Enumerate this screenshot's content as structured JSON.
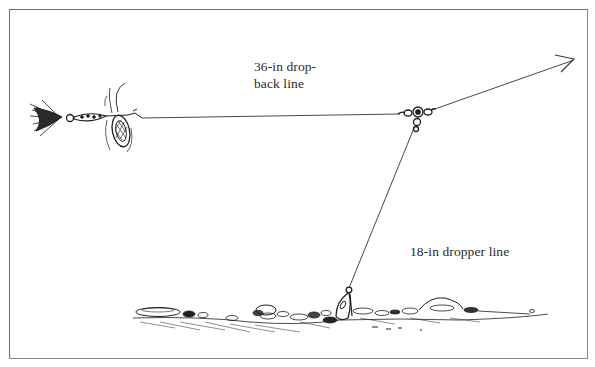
{
  "figure": {
    "labels": {
      "dropback_line_1": "36-in drop-",
      "dropback_line_2": "back line",
      "dropper_line": "18-in dropper line"
    },
    "elements": [
      {
        "name": "spinner-lure",
        "description": "in-line spinner with hair tail and blade, at end of drop-back line"
      },
      {
        "name": "three-way-swivel",
        "description": "three-way swivel connecting main line, drop-back line, and dropper line"
      },
      {
        "name": "main-line-arrow",
        "description": "main line leading up and right toward rod, with arrowhead"
      },
      {
        "name": "sinker",
        "description": "bell sinker on dropper line resting on rocky bottom"
      },
      {
        "name": "bottom",
        "description": "rocky lake/river bottom"
      }
    ],
    "colors": {
      "ink": "#1e1e1e",
      "border": "#6f6f6f",
      "background": "#ffffff"
    }
  }
}
